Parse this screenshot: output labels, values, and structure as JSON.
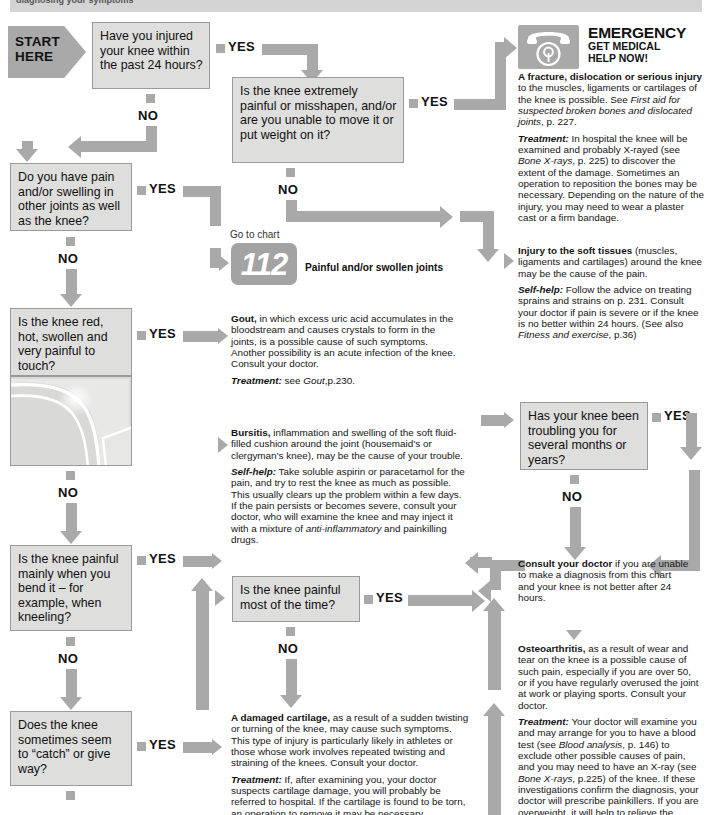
{
  "header": {
    "title": "diagnosing your symptoms"
  },
  "start": {
    "line1": "START",
    "line2": "HERE",
    "label": "START HERE"
  },
  "labels": {
    "yes": "YES",
    "no": "NO"
  },
  "questions": [
    {
      "id": "q-injured-24h",
      "text": "Have you injured your knee within the past 24 hours?"
    },
    {
      "id": "q-extremely-painful",
      "text": "Is the knee extremely painful or misshapen, and/or are you unable to move it or put weight on it?"
    },
    {
      "id": "q-other-joints",
      "text": "Do you have pain and/or swelling in other joints as well as the knee?"
    },
    {
      "id": "q-red-hot-swollen",
      "text": "Is the knee red, hot, swollen and very painful to touch?"
    },
    {
      "id": "q-painful-bending",
      "text": "Is the knee painful mainly when you bend it – for example, when kneeling?"
    },
    {
      "id": "q-catch-give-way",
      "text": "Does the knee sometimes seem to “catch” or give way?"
    },
    {
      "id": "q-painful-most-time",
      "text": "Is the knee painful most of the time?"
    },
    {
      "id": "q-troubling-months",
      "text": "Has your knee been troubling you for several months or years?"
    }
  ],
  "emergency": {
    "icon": "telephone-icon",
    "title": "EMERGENCY",
    "subtitle_line1": "GET MEDICAL",
    "subtitle_line2": "HELP NOW!",
    "body_lead": "A fracture, dislocation or serious injury",
    "body_rest": " to the muscles, ligaments or cartilages of the knee is possible. See ",
    "body_italic": "First aid for suspected broken bones and dislocated joints",
    "body_tail": ", p. 227.",
    "treatment_lead": "Treatment:",
    "treatment_part1": " In hospital the knee will be examined and probably X-rayed (see ",
    "treatment_italic": "Bone X-rays",
    "treatment_part2": ", p. 225) to discover the extent of the damage. Sometimes an operation to reposition the bones may be necessary. Depending on the nature of the injury, you may need to wear a plaster cast or a firm bandage."
  },
  "soft_tissues": {
    "lead": "Injury to the soft tissues",
    "rest": " (muscles, ligaments and cartilages) around the knee may be the cause of the pain.",
    "selfhelp_lead": "Self-help:",
    "selfhelp_part1": " Follow the advice on treating sprains and strains on p. 231. Consult your doctor if pain is severe or if the knee is no better within 24 hours. (See also ",
    "selfhelp_italic": "Fitness and exercise",
    "selfhelp_part2": ", p.36)"
  },
  "goto_chart": {
    "prefix": "Go to chart",
    "number": "112",
    "caption": "Painful and/or swollen joints"
  },
  "gout": {
    "lead": "Gout,",
    "rest": " in which excess uric acid accumulates in the bloodstream and causes crystals to form in the joints, is a possible cause of such symptoms. Another possibility is an acute infection of the knee. Consult your doctor.",
    "treatment_lead": "Treatment:",
    "treatment_part1": " see ",
    "treatment_italic": "Gout",
    "treatment_part2": ",p.230."
  },
  "bursitis": {
    "lead": "Bursitis,",
    "rest": " inflammation and swelling of the soft fluid-filled cushion around the joint (housemaid’s or clergyman’s knee), may be the cause of your trouble.",
    "selfhelp_lead": "Self-help:",
    "selfhelp_part1": " Take soluble aspirin or paracetamol for the pain, and try to rest the knee as much as possible. This usually clears up the problem within a few days. If the pain persists or becomes severe, consult your doctor, who will examine the knee and may inject it with a mixture of ",
    "selfhelp_italic": "anti-inflammatory",
    "selfhelp_part2": " and painkilling drugs."
  },
  "cartilage": {
    "lead": "A damaged cartilage,",
    "rest": " as a result of a sudden twisting or turning of the knee, may cause such symptoms. This type of injury is particularly likely in athletes or those whose work involves repeated twisting and straining of the knees. Consult your doctor.",
    "treatment_lead": "Treatment:",
    "treatment_rest": " If, after examining you, your doctor suspects cartilage damage, you will probably be referred to hospital. If the cartilage is found to be torn, an operation to remove it may be necessary."
  },
  "consult_doctor": {
    "lead": "Consult your doctor",
    "rest": " if you are unable to make a diagnosis from this chart and your knee is not better after 24 hours."
  },
  "osteoarthritis": {
    "lead": "Osteoarthritis,",
    "rest": " as a result of wear and tear on the knee is a possible cause of such pain, especially if you are over 50, or if you have regularly overused the joint at work or playing sports. Consult your doctor.",
    "treatment_lead": "Treatment:",
    "treatment_part1": " Your doctor will examine you and may arrange for you to have a blood test (see ",
    "treatment_italic1": "Blood analysis",
    "treatment_part2": ", p. 146) to exclude other possible causes of pain, and you may need to have an X-ray (see ",
    "treatment_italic2": "Bone X-rays",
    "treatment_part3": ", p.225) of the knee. If these investigations confirm the diagnosis, your doctor will prescribe painkillers. If you are overweight, it will help to relieve the strain on your knee if you try to lose"
  },
  "colors": {
    "arrow": "#a9a9a9",
    "box_fill": "#dededd",
    "box_border": "#9a9a9a",
    "header_strip": "#d4d4d4",
    "text": "#111111"
  }
}
